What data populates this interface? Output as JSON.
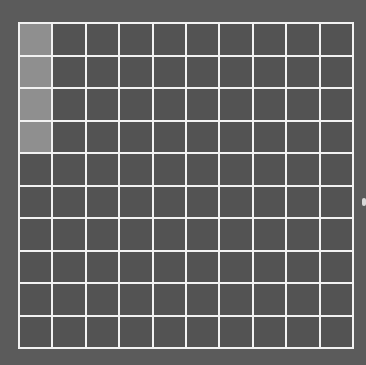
{
  "board": {
    "rows": 10,
    "cols": 10,
    "filled_cells": [
      [
        0,
        0
      ],
      [
        1,
        0
      ],
      [
        2,
        0
      ],
      [
        3,
        0
      ]
    ],
    "colors": {
      "background": "#5b5b5b",
      "grid_line": "#f2f2f2",
      "empty_cell": "#535353",
      "filled_cell": "#8f8f8f"
    }
  },
  "edge_marker": {
    "icon": "scroll-handle-icon"
  }
}
